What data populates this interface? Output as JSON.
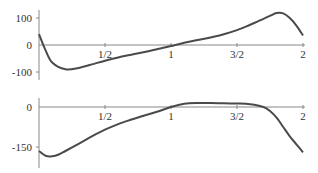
{
  "chart_data": [
    {
      "type": "line",
      "title": "",
      "xlabel": "",
      "ylabel": "",
      "xlim": [
        0,
        2
      ],
      "ylim": [
        -110,
        125
      ],
      "grid": false,
      "x_ticks": [
        "1/2",
        "1",
        "3/2",
        "2"
      ],
      "y_ticks": [
        "100",
        "0",
        "-100"
      ],
      "series": [
        {
          "name": "top",
          "x": [
            0,
            0.05,
            0.1,
            0.2,
            0.3,
            0.4,
            0.5,
            0.6,
            0.7,
            0.8,
            0.9,
            1.0,
            1.1,
            1.2,
            1.3,
            1.4,
            1.5,
            1.6,
            1.7,
            1.75,
            1.8,
            1.85,
            1.9,
            1.95,
            2.0
          ],
          "y": [
            40,
            -20,
            -65,
            -90,
            -85,
            -72,
            -58,
            -46,
            -36,
            -26,
            -15,
            -4,
            8,
            18,
            28,
            40,
            55,
            75,
            97,
            108,
            118,
            117,
            100,
            72,
            35
          ]
        }
      ]
    },
    {
      "type": "line",
      "title": "",
      "xlabel": "",
      "ylabel": "",
      "xlim": [
        0,
        2
      ],
      "ylim": [
        -195,
        25
      ],
      "grid": false,
      "x_ticks": [
        "1/2",
        "1",
        "3/2",
        "2"
      ],
      "y_ticks": [
        "0",
        "-150"
      ],
      "series": [
        {
          "name": "bottom",
          "x": [
            0,
            0.05,
            0.1,
            0.15,
            0.2,
            0.3,
            0.4,
            0.5,
            0.6,
            0.7,
            0.8,
            0.9,
            1.0,
            1.1,
            1.2,
            1.3,
            1.4,
            1.5,
            1.6,
            1.7,
            1.75,
            1.8,
            1.85,
            1.9,
            1.95,
            2.0
          ],
          "y": [
            -165,
            -183,
            -185,
            -178,
            -165,
            -138,
            -110,
            -85,
            -64,
            -47,
            -32,
            -17,
            0,
            12,
            15,
            15,
            14,
            13,
            10,
            0,
            -15,
            -40,
            -75,
            -110,
            -140,
            -170
          ]
        }
      ]
    }
  ],
  "top_panel": {
    "y_labels": [
      "100",
      "0",
      "-100"
    ],
    "x_labels": [
      "1/2",
      "1",
      "3/2",
      "2"
    ]
  },
  "bottom_panel": {
    "y_labels": [
      "0",
      "-150"
    ],
    "x_labels": [
      "1/2",
      "1",
      "3/2",
      "2"
    ]
  }
}
